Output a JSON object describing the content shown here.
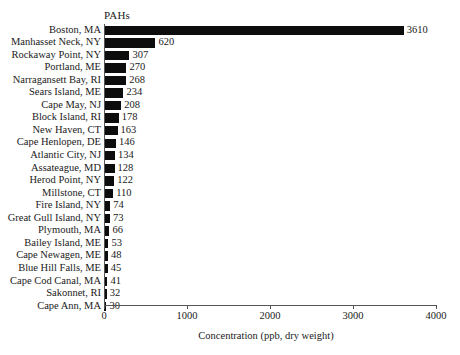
{
  "chart_data": {
    "type": "bar",
    "orientation": "horizontal",
    "title": "PAHs",
    "xlabel": "Concentration (ppb, dry weight)",
    "ylabel": "",
    "xlim": [
      0,
      4000
    ],
    "xticks": [
      0,
      1000,
      2000,
      3000,
      4000
    ],
    "xtick_labels": [
      "0",
      "1000",
      "2000",
      "3000",
      "4000"
    ],
    "grid": false,
    "legend": false,
    "bar_color": "#0d0d0d",
    "axis_color": "#555555",
    "categories": [
      "Boston, MA",
      "Manhasset Neck, NY",
      "Rockaway Point, NY",
      "Portland, ME",
      "Narragansett Bay, RI",
      "Sears Island, ME",
      "Cape May, NJ",
      "Block Island, RI",
      "New Haven, CT",
      "Cape Henlopen, DE",
      "Atlantic City, NJ",
      "Assateague, MD",
      "Herod Point, NY",
      "Millstone, CT",
      "Fire Island, NY",
      "Great Gull Island, NY",
      "Plymouth, MA",
      "Bailey Island, ME",
      "Cape Newagen, ME",
      "Blue Hill Falls, ME",
      "Cape Cod Canal, MA",
      "Sakonnet, RI",
      "Cape Ann, MA"
    ],
    "values": [
      3610,
      620,
      307,
      270,
      268,
      234,
      208,
      178,
      163,
      146,
      134,
      128,
      122,
      110,
      74,
      73,
      66,
      53,
      48,
      45,
      41,
      32,
      30
    ],
    "value_labels": [
      "3610",
      "620",
      "307",
      "270",
      "268",
      "234",
      "208",
      "178",
      "163",
      "146",
      "134",
      "128",
      "122",
      "110",
      "74",
      "73",
      "66",
      "53",
      "48",
      "45",
      "41",
      "32",
      "30"
    ]
  }
}
